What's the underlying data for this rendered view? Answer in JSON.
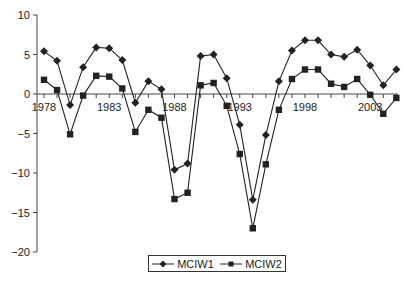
{
  "chart_data": {
    "type": "line",
    "title": "",
    "xlabel": "",
    "ylabel": "",
    "ylim": [
      -20,
      10
    ],
    "yticks": [
      10,
      5,
      0,
      -5,
      -10,
      -15,
      -20
    ],
    "xtick_labels": [
      "1978",
      "1983",
      "1988",
      "1993",
      "1998",
      "2003"
    ],
    "grid": false,
    "legend_position": "bottom",
    "x": [
      1978,
      1979,
      1980,
      1981,
      1982,
      1983,
      1984,
      1985,
      1986,
      1987,
      1988,
      1989,
      1990,
      1991,
      1992,
      1993,
      1994,
      1995,
      1996,
      1997,
      1998,
      1999,
      2000,
      2001,
      2002,
      2003,
      2004,
      2005
    ],
    "series": [
      {
        "name": "MCIW1",
        "marker": "diamond",
        "values": [
          5.4,
          4.2,
          -1.4,
          3.4,
          5.9,
          5.8,
          4.3,
          -1.1,
          1.6,
          0.6,
          -9.6,
          -8.8,
          4.8,
          5.0,
          2.0,
          -3.9,
          -13.4,
          -5.2,
          1.6,
          5.5,
          6.8,
          6.8,
          5.0,
          4.7,
          5.6,
          3.6,
          1.1,
          3.1
        ]
      },
      {
        "name": "MCIW2",
        "marker": "square",
        "values": [
          1.8,
          0.5,
          -5.1,
          -0.2,
          2.3,
          2.2,
          0.7,
          -4.8,
          -2.0,
          -3.0,
          -13.3,
          -12.5,
          1.1,
          1.4,
          -1.5,
          -7.6,
          -17.0,
          -8.9,
          -2.0,
          1.9,
          3.1,
          3.1,
          1.3,
          0.9,
          1.9,
          -0.1,
          -2.5,
          -0.5
        ]
      }
    ]
  },
  "legend": {
    "items": [
      {
        "label": "MCIW1",
        "marker": "diamond-icon"
      },
      {
        "label": "MCIW2",
        "marker": "square-icon"
      }
    ]
  },
  "colors": {
    "line": "#222222",
    "axis": "#444444",
    "text": "#222222"
  }
}
